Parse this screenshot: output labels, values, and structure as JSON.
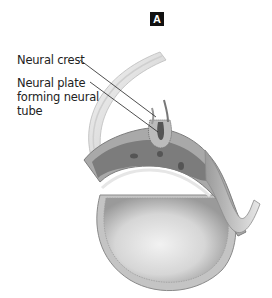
{
  "figure": {
    "panel_label": "A",
    "labels": [
      {
        "id": "neural-crest",
        "text": "Neural crest"
      },
      {
        "id": "neural-plate",
        "text": "Neural plate forming neural tube"
      }
    ],
    "colors": {
      "background": "#ffffff",
      "tissue_dark": "#7a7a7a",
      "tissue_mid": "#a8a8a8",
      "tissue_light": "#d4d4d4",
      "badge": "#111111"
    }
  }
}
